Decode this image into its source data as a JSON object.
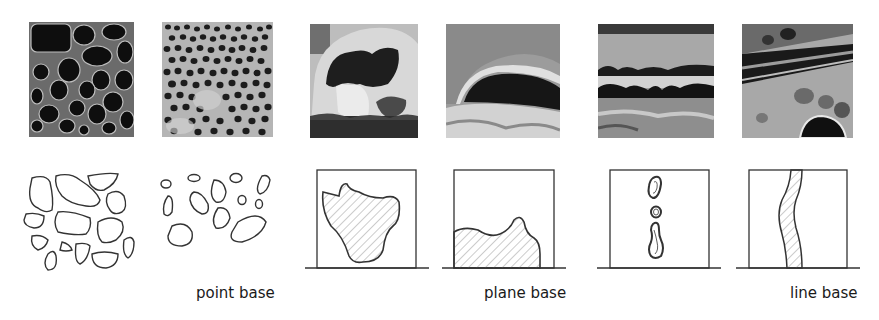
{
  "figure": {
    "groups": [
      {
        "id": "point",
        "label": "point base",
        "photos": [
          {
            "description": "honeycomb weathering with large dark cavities"
          },
          {
            "description": "dense fine honeycomb weathering with small pits"
          }
        ],
        "diagrams": [
          {
            "type": "large-cell-outlines"
          },
          {
            "type": "scattered-small-cell-outlines"
          }
        ]
      },
      {
        "id": "plane",
        "label": "plane base",
        "photos": [
          {
            "description": "large tafoni cavity in rock face"
          },
          {
            "description": "low horizontal overhanging cavity"
          }
        ],
        "diagrams": [
          {
            "type": "framed-irregular-hatched-area-floating"
          },
          {
            "type": "framed-hatched-area-grounded"
          }
        ]
      },
      {
        "id": "line",
        "label": "line base",
        "photos": [
          {
            "description": "horizontal bedding-plane cavities"
          },
          {
            "description": "linear fissure weathering with pits"
          }
        ],
        "diagrams": [
          {
            "type": "framed-vertical-chain-of-cells"
          },
          {
            "type": "framed-vertical-hatched-strip"
          }
        ]
      }
    ],
    "colors": {
      "stroke": "#333333",
      "hatch": "#9a9a9a",
      "background": "#ffffff"
    }
  }
}
